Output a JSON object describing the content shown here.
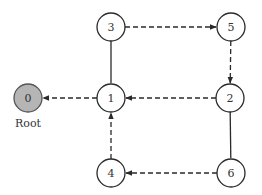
{
  "colors": {
    "stroke": "#2a2a2a",
    "node_fill": "#ffffff",
    "root_fill": "#b5b5b5",
    "root_stroke": "#555555",
    "text": "#333333"
  },
  "nodes": [
    {
      "id": "0",
      "label": "0",
      "x": 28,
      "y": 98,
      "root": true
    },
    {
      "id": "1",
      "label": "1",
      "x": 111,
      "y": 98,
      "root": false
    },
    {
      "id": "2",
      "label": "2",
      "x": 230,
      "y": 98,
      "root": false
    },
    {
      "id": "3",
      "label": "3",
      "x": 111,
      "y": 27,
      "root": false
    },
    {
      "id": "4",
      "label": "4",
      "x": 111,
      "y": 173,
      "root": false
    },
    {
      "id": "5",
      "label": "5",
      "x": 231,
      "y": 27,
      "root": false
    },
    {
      "id": "6",
      "label": "6",
      "x": 231,
      "y": 173,
      "root": false
    }
  ],
  "edges": [
    {
      "from": "1",
      "to": "0",
      "style": "dashed",
      "directed": true
    },
    {
      "from": "2",
      "to": "1",
      "style": "dashed",
      "directed": true
    },
    {
      "from": "3",
      "to": "5",
      "style": "dashed",
      "directed": true
    },
    {
      "from": "5",
      "to": "2",
      "style": "dashed",
      "directed": true
    },
    {
      "from": "4",
      "to": "1",
      "style": "dashed",
      "directed": true
    },
    {
      "from": "6",
      "to": "4",
      "style": "dashed",
      "directed": true
    },
    {
      "from": "3",
      "to": "1",
      "style": "solid",
      "directed": false
    },
    {
      "from": "2",
      "to": "6",
      "style": "solid",
      "directed": false
    }
  ],
  "root_caption": "Root",
  "node_radius": 14
}
